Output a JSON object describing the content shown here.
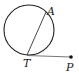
{
  "diagram": {
    "type": "geometry",
    "circle": {
      "cx": 29,
      "cy": 30,
      "r": 25
    },
    "points": {
      "A": {
        "label": "A",
        "x": 47,
        "y": 13
      },
      "T": {
        "label": "T",
        "x": 27,
        "y": 55
      },
      "P": {
        "label": "P",
        "x": 71,
        "y": 57
      }
    },
    "segments": [
      {
        "from": "T",
        "to": "A",
        "kind": "chord"
      },
      {
        "from": "T",
        "to": "P",
        "kind": "tangent"
      }
    ],
    "colors": {
      "stroke": "#222222",
      "tangent": "#666666"
    }
  }
}
